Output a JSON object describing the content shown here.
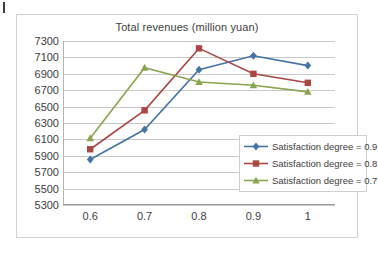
{
  "corner_mark": {
    "name": "page-corner-mark"
  },
  "chart_data": {
    "type": "line",
    "title": "Total revenues (million yuan)",
    "xlabel": "",
    "ylabel": "",
    "x": [
      0.6,
      0.7,
      0.8,
      0.9,
      1
    ],
    "categories": [
      "0.6",
      "0.7",
      "0.8",
      "0.9",
      "1"
    ],
    "ylim": [
      5300,
      7300
    ],
    "yticks": [
      5300,
      5500,
      5700,
      5900,
      6100,
      6300,
      6500,
      6700,
      6900,
      7100,
      7300
    ],
    "ytick_labels": [
      "5300",
      "5500",
      "5700",
      "5900",
      "6100",
      "6300",
      "6500",
      "6700",
      "6900",
      "7100",
      "7300"
    ],
    "grid": true,
    "legend_position": "right-inside",
    "series": [
      {
        "name": "Satisfaction degree = 0.9",
        "color": "#4573a7",
        "marker": "diamond",
        "values": [
          5855,
          6220,
          6950,
          7120,
          7000
        ]
      },
      {
        "name": "Satisfaction degree = 0.8",
        "color": "#aa4643",
        "marker": "square",
        "values": [
          5980,
          6455,
          7210,
          6900,
          6790
        ]
      },
      {
        "name": "Satisfaction degree = 0.7",
        "color": "#89a54e",
        "marker": "triangle",
        "values": [
          6115,
          6975,
          6800,
          6760,
          6680
        ]
      }
    ]
  }
}
